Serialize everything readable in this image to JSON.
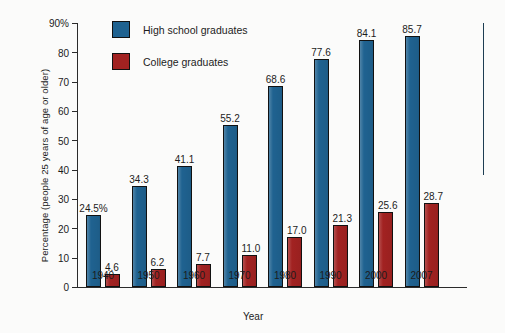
{
  "chart_data": {
    "type": "bar",
    "title": "",
    "subtitle": "",
    "xlabel": "Year",
    "ylabel": "Percentage (people 25 years of age or older)",
    "categories": [
      "1940",
      "1950",
      "1960",
      "1970",
      "1980",
      "1990",
      "2000",
      "2007"
    ],
    "series": [
      {
        "name": "High school graduates",
        "color": "#1f6290",
        "values": [
          24.5,
          34.3,
          41.1,
          55.2,
          68.6,
          77.6,
          84.1,
          85.7
        ],
        "labels": [
          "24.5%",
          "34.3",
          "41.1",
          "55.2",
          "68.6",
          "77.6",
          "84.1",
          "85.7"
        ]
      },
      {
        "name": "College graduates",
        "color": "#a22221",
        "values": [
          4.6,
          6.2,
          7.7,
          11.0,
          17.0,
          21.3,
          25.6,
          28.7
        ],
        "labels": [
          "4.6",
          "6.2",
          "7.7",
          "11.0",
          "17.0",
          "21.3",
          "25.6",
          "28.7"
        ]
      }
    ],
    "ylim": [
      0,
      90
    ],
    "yticks": [
      0,
      10,
      20,
      30,
      40,
      50,
      60,
      70,
      80,
      90
    ],
    "ytick_labels": [
      "0",
      "10",
      "20",
      "30",
      "40",
      "50",
      "60",
      "70",
      "80",
      "90%"
    ],
    "grid": false,
    "legend_position": "top-left-inside"
  },
  "legend": {
    "items": [
      {
        "label": "High school graduates",
        "swatch": "legend-swatch-high-school"
      },
      {
        "label": "College graduates",
        "swatch": "legend-swatch-college"
      }
    ]
  }
}
